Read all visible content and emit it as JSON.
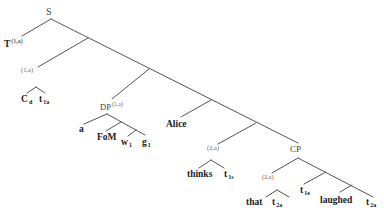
{
  "diagram": {
    "type": "syntax-tree",
    "line_color": "#555555",
    "nodes": {
      "root": {
        "label": "S"
      },
      "t_node": {
        "label": "T",
        "sup": "(1,a)"
      },
      "idx1": {
        "label": "(1,a)"
      },
      "cd": {
        "label": "C",
        "sub": "d"
      },
      "t1a": {
        "label": "t",
        "sub": "1a"
      },
      "dp": {
        "label": "DP",
        "sup": "(1,a)"
      },
      "a": {
        "label": "a"
      },
      "fom": {
        "label": "FoM"
      },
      "w1": {
        "label": "w",
        "sub": "1"
      },
      "g1": {
        "label": "g",
        "sub": "1"
      },
      "alice": {
        "label": "Alice"
      },
      "idx2": {
        "label": "(2,a)"
      },
      "thinks": {
        "label": "thinks"
      },
      "t1s": {
        "label": "t",
        "sub": "1s"
      },
      "cp": {
        "label": "CP"
      },
      "idx3": {
        "label": "(2,s)"
      },
      "that": {
        "label": "that"
      },
      "t2a_1": {
        "label": "t",
        "sub": "2a"
      },
      "t1e": {
        "label": "t",
        "sub": "1e"
      },
      "laughed": {
        "label": "laughed"
      },
      "t2a_2": {
        "label": "t",
        "sub": "2a"
      }
    }
  }
}
